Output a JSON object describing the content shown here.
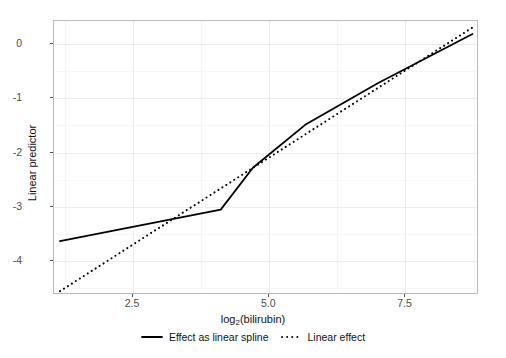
{
  "chart_data": {
    "type": "line",
    "title": "",
    "xlabel": "log2(bilirubin)",
    "xlabel_base": "log",
    "xlabel_sub": "2",
    "xlabel_rest": "(bilirubin)",
    "ylabel": "Linear predictor",
    "xlim": [
      1.05,
      8.85
    ],
    "ylim": [
      -4.62,
      0.42
    ],
    "xticks": [
      2.5,
      5.0,
      7.5
    ],
    "xtick_labels": [
      "2.5",
      "5.0",
      "7.5"
    ],
    "yticks": [
      0,
      -1,
      -2,
      -3,
      -4
    ],
    "ytick_labels": [
      "0",
      "-1",
      "-2",
      "-3",
      "-4"
    ],
    "grid": true,
    "legend_position": "bottom",
    "series": [
      {
        "name": "Effect as linear spline",
        "style": "solid",
        "color": "#000000",
        "x": [
          1.16,
          4.11,
          4.7,
          5.66,
          7.0,
          8.73
        ],
        "y": [
          -3.63,
          -3.05,
          -2.28,
          -1.49,
          -0.72,
          0.18
        ]
      },
      {
        "name": "Linear effect",
        "style": "dotted",
        "color": "#000000",
        "x": [
          1.16,
          8.73
        ],
        "y": [
          -4.55,
          0.3
        ]
      }
    ]
  },
  "legend": {
    "items": [
      {
        "label": "Effect as linear spline",
        "style": "solid"
      },
      {
        "label": "Linear effect",
        "style": "dotted"
      }
    ]
  }
}
